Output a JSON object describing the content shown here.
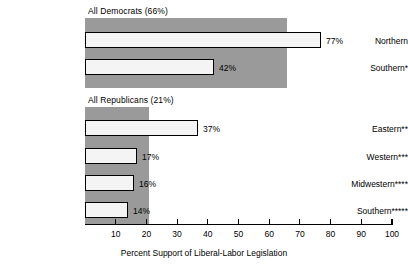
{
  "chart_data": {
    "type": "bar",
    "orientation": "horizontal",
    "title": "",
    "xlabel": "Percent Support of Liberal-Labor Legislation",
    "ylabel": "",
    "xlim": [
      0,
      100
    ],
    "xticks": [
      10,
      20,
      30,
      40,
      50,
      60,
      70,
      80,
      90,
      100
    ],
    "xtick_labels": [
      "10",
      "20",
      "30",
      "40",
      "50",
      "60",
      "70",
      "80",
      "90",
      "100"
    ],
    "grid": false,
    "legend": "none",
    "value_suffix": "%",
    "groups": [
      {
        "name": "all-democrats",
        "header": "All Democrats (66%)",
        "band_value": 66,
        "categories": [
          "Northern",
          "Southern*"
        ],
        "values": [
          77,
          42
        ],
        "value_labels": [
          "77%",
          "42%"
        ]
      },
      {
        "name": "all-republicans",
        "header": "All Republicans (21%)",
        "band_value": 21,
        "categories": [
          "Eastern**",
          "Western***",
          "Midwestern****",
          "Southern*****"
        ],
        "values": [
          37,
          17,
          16,
          14
        ],
        "value_labels": [
          "37%",
          "17%",
          "16%",
          "14%"
        ]
      }
    ],
    "colors": {
      "band": "#9a9a9a",
      "bar_fill": "#f4f4f4",
      "bar_border": "#000000",
      "axis": "#000000",
      "text": "#000000",
      "background": "#ffffff"
    }
  },
  "groups": {
    "democrats": {
      "header": "All Democrats (66%)",
      "rows": [
        {
          "label": "Northern",
          "value_label": "77%"
        },
        {
          "label": "Southern*",
          "value_label": "42%"
        }
      ]
    },
    "republicans": {
      "header": "All Republicans (21%)",
      "rows": [
        {
          "label": "Eastern**",
          "value_label": "37%"
        },
        {
          "label": "Western***",
          "value_label": "17%"
        },
        {
          "label": "Midwestern****",
          "value_label": "16%"
        },
        {
          "label": "Southern*****",
          "value_label": "14%"
        }
      ]
    }
  },
  "axis": {
    "title": "Percent Support of Liberal-Labor Legislation",
    "ticks": [
      "10",
      "20",
      "30",
      "40",
      "50",
      "60",
      "70",
      "80",
      "90",
      "100"
    ]
  }
}
